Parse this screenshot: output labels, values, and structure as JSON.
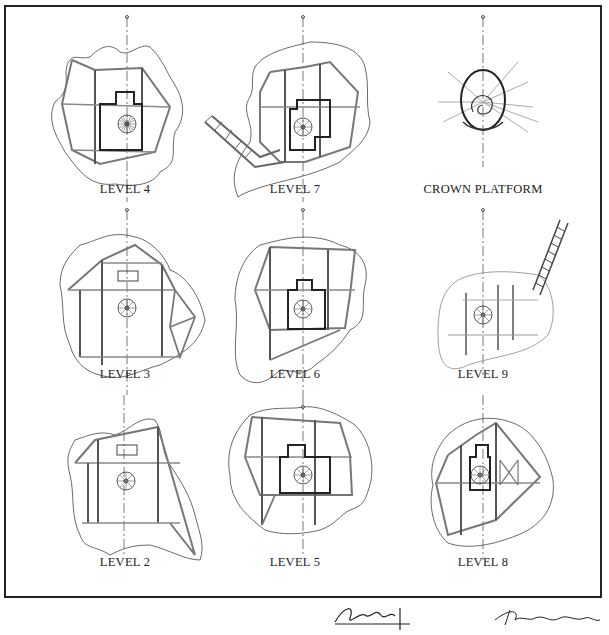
{
  "sheet": {
    "title": "Tree house floor plans by level",
    "plans": [
      {
        "id": "level-4",
        "label": "LEVEL 4",
        "row": 0,
        "col": 0
      },
      {
        "id": "level-7",
        "label": "LEVEL 7",
        "row": 0,
        "col": 1
      },
      {
        "id": "crown-platform",
        "label": "CROWN PLATFORM",
        "row": 0,
        "col": 2
      },
      {
        "id": "level-3",
        "label": "LEVEL 3",
        "row": 1,
        "col": 0
      },
      {
        "id": "level-6",
        "label": "LEVEL 6",
        "row": 1,
        "col": 1
      },
      {
        "id": "level-9",
        "label": "LEVEL 9",
        "row": 1,
        "col": 2
      },
      {
        "id": "level-2",
        "label": "LEVEL 2",
        "row": 2,
        "col": 0
      },
      {
        "id": "level-5",
        "label": "LEVEL 5",
        "row": 2,
        "col": 1
      },
      {
        "id": "level-8",
        "label": "LEVEL 8",
        "row": 2,
        "col": 2
      }
    ],
    "signatures": [
      "handwritten-signature-1",
      "handwritten-signature-2"
    ]
  },
  "colors": {
    "ink": "#222222",
    "light_ink": "#9a9a9a",
    "paper": "#ffffff"
  }
}
